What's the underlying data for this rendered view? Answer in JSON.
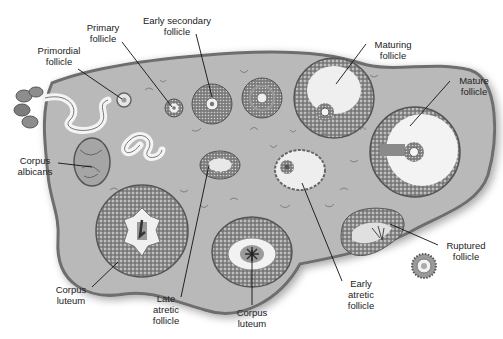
{
  "figure": {
    "style": "grayscale illustration"
  },
  "labels": [
    {
      "id": "primordial",
      "text": "Primordial\nfollicle",
      "x": 34,
      "y": 52,
      "w": 50,
      "align": "center"
    },
    {
      "id": "primary",
      "text": "Primary\nfollicle",
      "x": 82,
      "y": 23,
      "w": 44,
      "align": "center"
    },
    {
      "id": "early-secondary",
      "text": "Early secondary\nfollicle",
      "x": 136,
      "y": 16,
      "w": 80,
      "align": "center"
    },
    {
      "id": "maturing",
      "text": "Maturing\nfollicle",
      "x": 365,
      "y": 40,
      "w": 50,
      "align": "center"
    },
    {
      "id": "mature",
      "text": "Mature\nfollicle",
      "x": 448,
      "y": 75,
      "w": 44,
      "align": "center"
    },
    {
      "id": "corpus-albicans",
      "text": "Corpus\nalbicans",
      "x": 14,
      "y": 158,
      "w": 44,
      "align": "center"
    },
    {
      "id": "corpus-luteum-left",
      "text": "Corpus\nluteum",
      "x": 50,
      "y": 284,
      "w": 44,
      "align": "center"
    },
    {
      "id": "late-atretic",
      "text": "Late\natretic\nfollicle",
      "x": 147,
      "y": 295,
      "w": 40,
      "align": "center"
    },
    {
      "id": "corpus-luteum-bottom",
      "text": "Corpus\nluteum",
      "x": 230,
      "y": 305,
      "w": 44,
      "align": "center"
    },
    {
      "id": "early-atretic",
      "text": "Early\natretic\nfollicle",
      "x": 343,
      "y": 278,
      "w": 40,
      "align": "center"
    },
    {
      "id": "ruptured",
      "text": "Ruptured\nfollicle",
      "x": 438,
      "y": 239,
      "w": 50,
      "align": "center"
    }
  ],
  "leaders": [
    {
      "id": "primordial",
      "x1": 78,
      "y1": 69,
      "x2": 122,
      "y2": 99
    },
    {
      "id": "primary",
      "x1": 122,
      "y1": 42,
      "x2": 172,
      "y2": 107
    },
    {
      "id": "early-secondary",
      "x1": 196,
      "y1": 34,
      "x2": 212,
      "y2": 97
    },
    {
      "id": "maturing",
      "x1": 366,
      "y1": 44,
      "x2": 336,
      "y2": 84
    },
    {
      "id": "mature",
      "x1": 450,
      "y1": 81,
      "x2": 410,
      "y2": 126
    },
    {
      "id": "corpus-albicans",
      "x1": 58,
      "y1": 163,
      "x2": 92,
      "y2": 167
    },
    {
      "id": "corpus-luteum-left",
      "x1": 92,
      "y1": 287,
      "x2": 118,
      "y2": 262
    },
    {
      "id": "late-atretic",
      "x1": 181,
      "y1": 297,
      "x2": 209,
      "y2": 165
    },
    {
      "id": "corpus-luteum-bottom",
      "x1": 252,
      "y1": 305,
      "x2": 252,
      "y2": 250
    },
    {
      "id": "early-atretic",
      "x1": 342,
      "y1": 281,
      "x2": 302,
      "y2": 183
    },
    {
      "id": "ruptured",
      "x1": 438,
      "y1": 245,
      "x2": 390,
      "y2": 224
    }
  ],
  "colors": {
    "stroma": "#b8b8b8",
    "capsule": "#7a7a7a",
    "tissue_dark": "#6a6a6a",
    "tissue_mid": "#8e8e8e",
    "antrum": "#f2f2f2",
    "text": "#222222",
    "leader": "#111111"
  }
}
